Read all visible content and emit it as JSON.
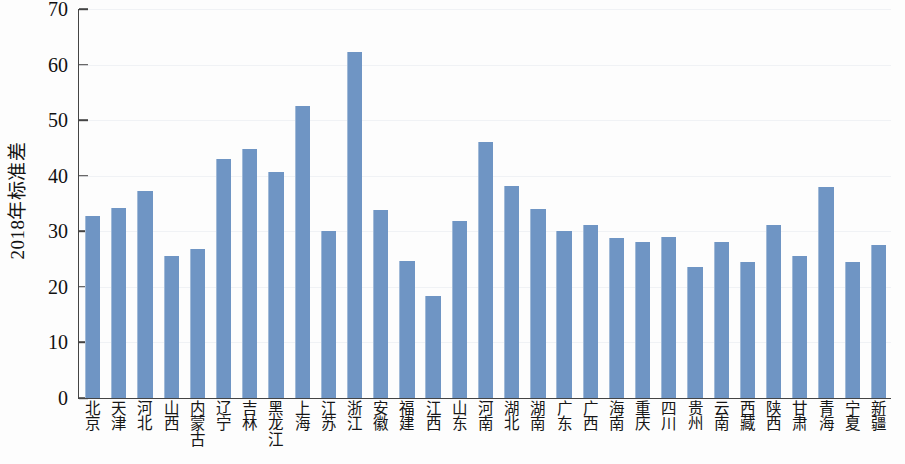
{
  "chart_data": {
    "type": "bar",
    "title": "",
    "subtitle": "",
    "xlabel": "",
    "ylabel": "2018年标准差",
    "ylim": [
      0,
      70
    ],
    "ytick_values": [
      0,
      10,
      20,
      30,
      40,
      50,
      60,
      70
    ],
    "ytick_labels": [
      "0",
      "10",
      "20",
      "30",
      "40",
      "50",
      "60",
      "70"
    ],
    "grid": true,
    "grid_axis": "y",
    "legend": false,
    "legend_position": "none",
    "bar_color": "#6f95c4",
    "axis_color": "#444444",
    "background_color": "#fdfdfd",
    "categories": [
      "北京",
      "天津",
      "河北",
      "山西",
      "内蒙古",
      "辽宁",
      "吉林",
      "黑龙江",
      "上海",
      "江苏",
      "浙江",
      "安徽",
      "福建",
      "江西",
      "山东",
      "河南",
      "湖北",
      "湖南",
      "广东",
      "广西",
      "海南",
      "重庆",
      "四川",
      "贵州",
      "云南",
      "西藏",
      "陕西",
      "甘肃",
      "青海",
      "宁夏",
      "新疆"
    ],
    "values": [
      32.8,
      34.2,
      37.3,
      25.6,
      26.8,
      43.1,
      44.8,
      40.7,
      52.5,
      30.1,
      62.2,
      33.8,
      24.6,
      18.3,
      31.8,
      46.0,
      38.2,
      34.1,
      30.0,
      31.1,
      28.8,
      28.0,
      28.9,
      23.5,
      28.1,
      24.4,
      31.1,
      25.5,
      38.0,
      24.4,
      27.5
    ]
  }
}
